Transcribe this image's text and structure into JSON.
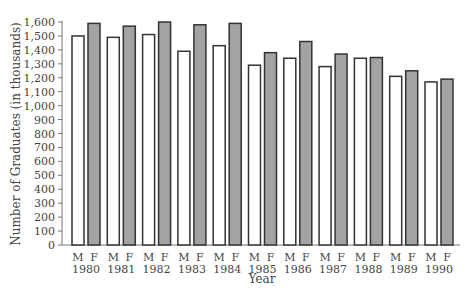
{
  "chart_data": {
    "type": "bar",
    "title": "",
    "xlabel": "Year",
    "ylabel": "Number of Graduates (in thousands)",
    "ylim": [
      0,
      1600
    ],
    "yticks": [
      0,
      100,
      200,
      300,
      400,
      500,
      600,
      700,
      800,
      900,
      1000,
      1100,
      1200,
      1300,
      1400,
      1500,
      1600
    ],
    "ytick_labels": [
      "0",
      "100",
      "200",
      "300",
      "400",
      "500",
      "600",
      "700",
      "800",
      "900",
      "1,000",
      "1,100",
      "1,200",
      "1,300",
      "1,400",
      "1,500",
      "1,600"
    ],
    "grid": false,
    "legend": "none (bars labeled M and F beneath each pair)",
    "categories": [
      "1980",
      "1981",
      "1982",
      "1983",
      "1984",
      "1985",
      "1986",
      "1987",
      "1988",
      "1989",
      "1990"
    ],
    "series": [
      {
        "name": "M",
        "color": "#ffffff",
        "values": [
          1500,
          1490,
          1510,
          1390,
          1430,
          1290,
          1340,
          1280,
          1340,
          1210,
          1170
        ]
      },
      {
        "name": "F",
        "color": "#a3a3a3",
        "values": [
          1590,
          1570,
          1600,
          1580,
          1590,
          1380,
          1460,
          1370,
          1345,
          1250,
          1190
        ]
      }
    ]
  },
  "colors": {
    "axis": "#777777",
    "bar_outline": "#333333",
    "male_fill": "#ffffff",
    "female_fill": "#a3a3a3"
  }
}
